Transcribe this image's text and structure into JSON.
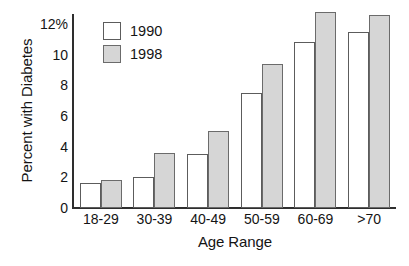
{
  "chart_data": {
    "type": "bar",
    "title": "",
    "xlabel": "Age Range",
    "ylabel": "Percent with Diabetes",
    "categories": [
      "18-29",
      "30-39",
      "40-49",
      "50-59",
      "60-69",
      ">70"
    ],
    "series": [
      {
        "name": "1990",
        "color": "#ffffff",
        "values": [
          1.6,
          2.05,
          3.5,
          7.5,
          10.8,
          11.5
        ]
      },
      {
        "name": "1998",
        "color": "#d6d6d6",
        "values": [
          1.8,
          3.6,
          5.0,
          9.4,
          12.8,
          12.6
        ]
      }
    ],
    "ylim": [
      0,
      12.65
    ],
    "yticks": [
      0,
      2,
      4,
      6,
      8,
      10,
      12
    ],
    "ytick_labels": [
      "0",
      "2",
      "4",
      "6",
      "8",
      "10",
      "12%"
    ],
    "grid": false,
    "legend_position": "top-left"
  },
  "legend": {
    "entries": [
      {
        "label": "1990",
        "swatch": "white-square-swatch"
      },
      {
        "label": "1998",
        "swatch": "gray-square-swatch"
      }
    ]
  },
  "axes": {
    "y_title": "Percent with Diabetes",
    "x_title": "Age Range"
  }
}
